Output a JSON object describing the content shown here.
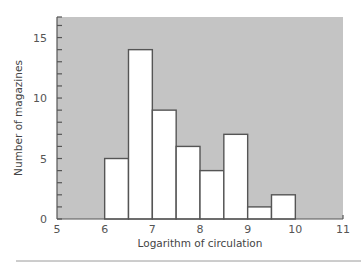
{
  "chart_data": {
    "type": "bar",
    "title": "",
    "xlabel": "Logarithm of circulation",
    "ylabel": "Number of magazines",
    "xlim": [
      5,
      11
    ],
    "ylim": [
      0,
      16.7
    ],
    "xticks": [
      5,
      6,
      7,
      8,
      9,
      10,
      11
    ],
    "yticks": [
      0,
      5,
      10,
      15
    ],
    "y_minor_tick_step": 1,
    "grid": false,
    "legend": null,
    "bin_width": 0.5,
    "bins": [
      {
        "x0": 6.0,
        "x1": 6.5,
        "count": 5
      },
      {
        "x0": 6.5,
        "x1": 7.0,
        "count": 14
      },
      {
        "x0": 7.0,
        "x1": 7.5,
        "count": 9
      },
      {
        "x0": 7.5,
        "x1": 8.0,
        "count": 6
      },
      {
        "x0": 8.0,
        "x1": 8.5,
        "count": 4
      },
      {
        "x0": 8.5,
        "x1": 9.0,
        "count": 7
      },
      {
        "x0": 9.0,
        "x1": 9.5,
        "count": 1
      },
      {
        "x0": 9.5,
        "x1": 10.0,
        "count": 2
      }
    ],
    "categories": [
      "6.0-6.5",
      "6.5-7.0",
      "7.0-7.5",
      "7.5-8.0",
      "8.0-8.5",
      "8.5-9.0",
      "9.0-9.5",
      "9.5-10.0"
    ],
    "values": [
      5,
      14,
      9,
      6,
      4,
      7,
      1,
      2
    ],
    "colors": {
      "plot_background": "#c4c4c4",
      "bar_fill": "#ffffff",
      "bar_stroke": "#555555"
    }
  }
}
